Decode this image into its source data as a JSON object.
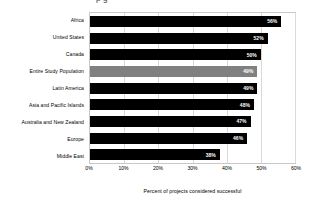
{
  "chart_data": {
    "type": "bar",
    "orientation": "horizontal",
    "title": "",
    "subtitle": "",
    "xlabel": "Percent of projects considered successful",
    "ylabel": "",
    "categories": [
      "Africa",
      "United States",
      "Canada",
      "Entire Study Population",
      "Latin America",
      "Asia and Pacific Islands",
      "Australia and New Zealand",
      "Europe",
      "Middle East"
    ],
    "values": [
      56,
      52,
      50,
      49,
      49,
      48,
      47,
      46,
      38
    ],
    "value_labels": [
      "56%",
      "52%",
      "50%",
      "49%",
      "49%",
      "48%",
      "47%",
      "46%",
      "38%"
    ],
    "highlight_index": 3,
    "xlim": [
      0,
      60
    ],
    "xticks": [
      0,
      10,
      20,
      30,
      40,
      50,
      60
    ],
    "xtick_labels": [
      "0%",
      "10%",
      "20%",
      "30%",
      "40%",
      "50%",
      "60%"
    ],
    "grid": true,
    "grid_axis": "x",
    "legend": false,
    "bar_color": "#000000",
    "highlight_color": "#808080",
    "value_label_color": "#ffffff",
    "plot_border_color": "#c8c8c8",
    "gridline_color": "#d9d9d9"
  },
  "clipped_title": "p g"
}
